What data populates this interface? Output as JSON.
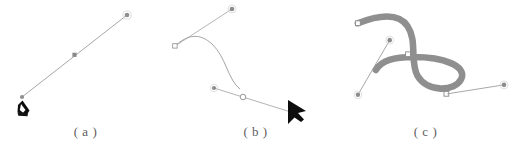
{
  "figure": {
    "background_color": "#ffffff",
    "panel_count": 3
  },
  "panels": [
    {
      "id": "a",
      "caption": "( a )",
      "description": "straight path segment drawn with pen tool, two endpoint anchors and one midpoint anchor, pen cursor at start",
      "stroke_color": "#9a9a9a",
      "anchor_color": "#8c8c8c",
      "cursor": "pen-tool-cursor"
    },
    {
      "id": "b",
      "caption": "( b )",
      "description": "bezier curve with direction handles being dragged, hollow anchor points and solid handle dots, arrow selection cursor",
      "stroke_color": "#8f8f8f",
      "anchor_color": "#8c8c8c",
      "cursor": "arrow-pointer-cursor"
    },
    {
      "id": "c",
      "caption": "( c )",
      "description": "finished thick gray stroked S-shaped path with selected anchor squares and direction handles",
      "stroke_color": "#8e8e8e",
      "path_stroke_width": "7",
      "anchor_color": "#8c8c8c",
      "cursor": "none"
    }
  ]
}
